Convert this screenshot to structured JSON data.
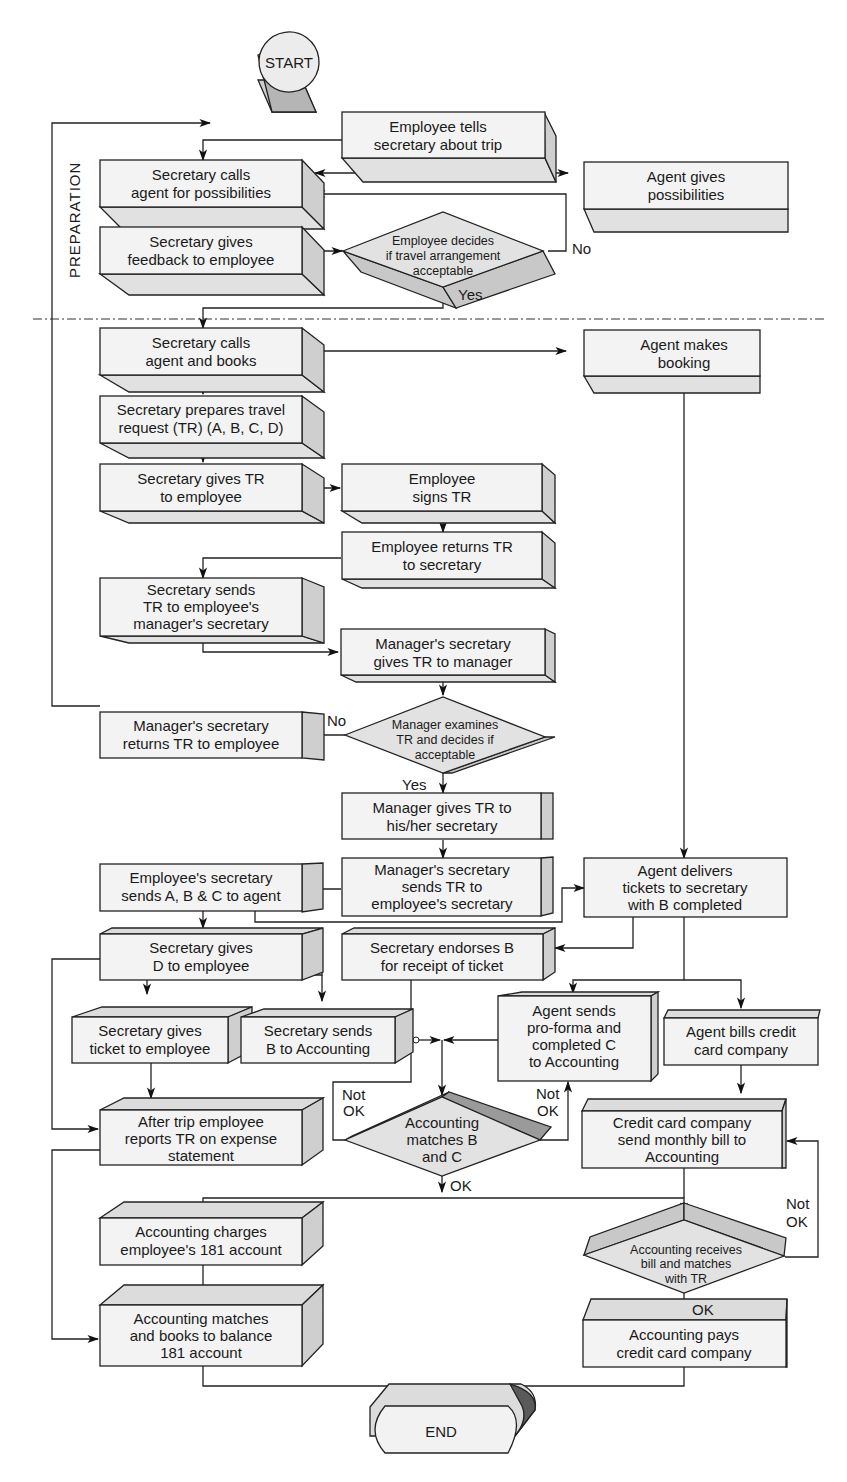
{
  "diagram": {
    "type": "flowchart",
    "section_label": "PREPARATION",
    "terminals": {
      "start": "START",
      "end": "END"
    },
    "nodes": {
      "employee_tells": [
        "Employee tells",
        "secretary  about trip"
      ],
      "secretary_calls_agent": [
        "Secretary calls",
        "agent for possibilities"
      ],
      "agent_gives": [
        "Agent gives",
        "possibilities"
      ],
      "secretary_feedback": [
        "Secretary gives",
        "feedback to employee"
      ],
      "employee_decides": [
        "Employee decides",
        "if travel arrangement",
        "acceptable"
      ],
      "secretary_books": [
        "Secretary calls",
        "agent and books"
      ],
      "agent_booking": [
        "Agent makes",
        "booking"
      ],
      "secretary_prepares": [
        "Secretary prepares travel",
        "request (TR) (A, B, C, D)"
      ],
      "secretary_gives_tr": [
        "Secretary gives TR",
        "to employee"
      ],
      "employee_signs": [
        "Employee",
        "signs TR"
      ],
      "employee_returns": [
        "Employee returns TR",
        "to secretary"
      ],
      "secretary_sends_mgr": [
        "Secretary sends",
        "TR to employee's",
        "manager's secretary"
      ],
      "mgr_sec_gives": [
        "Manager's secretary",
        "gives TR to manager"
      ],
      "mgr_sec_returns": [
        "Manager's secretary",
        "returns TR to employee"
      ],
      "manager_examines": [
        "Manager examines",
        "TR and decides if",
        "acceptable"
      ],
      "manager_gives": [
        "Manager gives TR to",
        "his/her secretary"
      ],
      "mgr_sec_sends": [
        "Manager's secretary",
        "sends TR to",
        "employee's secretary"
      ],
      "emp_sec_sends": [
        "Employee's secretary",
        "sends A, B & C to agent"
      ],
      "agent_delivers": [
        "Agent delivers",
        "tickets to secretary",
        "with B completed"
      ],
      "secretary_gives_d": [
        "Secretary gives",
        "D to employee"
      ],
      "secretary_endorses": [
        "Secretary endorses B",
        "for receipt of ticket"
      ],
      "secretary_ticket": [
        "Secretary gives",
        "ticket to employee"
      ],
      "secretary_sends_b": [
        "Secretary sends",
        "B to Accounting"
      ],
      "agent_sends_proforma": [
        "Agent sends",
        "pro-forma and",
        "completed C",
        "to Accounting"
      ],
      "agent_bills": [
        "Agent bills credit",
        "card company"
      ],
      "after_trip": [
        "After trip employee",
        "reports TR on expense",
        "statement"
      ],
      "accounting_matches_bc": [
        "Accounting",
        "matches B",
        "and C"
      ],
      "cc_company_sends": [
        "Credit card company",
        "send monthly bill to",
        "Accounting"
      ],
      "accounting_charges": [
        "Accounting charges",
        "employee's 181 account"
      ],
      "accounting_receives": [
        "Accounting receives",
        "bill and matches",
        "with TR"
      ],
      "accounting_books": [
        "Accounting matches",
        "and books to balance",
        "181 account"
      ],
      "accounting_pays": [
        "Accounting pays",
        "credit card company"
      ]
    },
    "edge_labels": {
      "no_1": "No",
      "yes_1": "Yes",
      "no_2": "No",
      "yes_2": "Yes",
      "not_ok_left": [
        "Not",
        "OK"
      ],
      "not_ok_right": [
        "Not",
        "OK"
      ],
      "ok_1": "OK",
      "not_ok_cc": [
        "Not",
        "OK"
      ],
      "ok_2": "OK"
    }
  }
}
